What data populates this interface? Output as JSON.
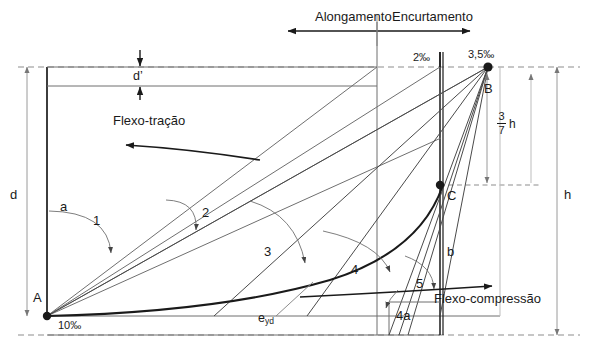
{
  "diagram": {
    "top_axis": {
      "left_label": "Alongamento",
      "right_label": "Encurtamento"
    },
    "points": [
      {
        "id": "A",
        "label": "A",
        "x": 47,
        "y": 316
      },
      {
        "id": "B",
        "label": "B",
        "x": 488,
        "y": 67
      },
      {
        "id": "C",
        "label": "C",
        "x": 440,
        "y": 185
      }
    ],
    "strain_labels": {
      "bottom_left": "10‰",
      "top_mid": "2‰",
      "top_right": "3,5‰",
      "yield": "e",
      "yield_sub": "yd"
    },
    "dimensions": {
      "d_prime": "d’",
      "d": "d",
      "h": "h",
      "fraction_numerator": "3",
      "fraction_denominator": "7",
      "fraction_unit": "h"
    },
    "flow_labels": {
      "tension": "Flexo-tração",
      "compression": "Flexo-compressão"
    },
    "region_labels": [
      {
        "name": "a",
        "text": "a",
        "x": 60,
        "y": 200
      },
      {
        "name": "b",
        "text": "b",
        "x": 447,
        "y": 245
      },
      {
        "name": "domain-1",
        "text": "1",
        "x": 93,
        "y": 221
      },
      {
        "name": "domain-2",
        "text": "2",
        "x": 202,
        "y": 213
      },
      {
        "name": "domain-3",
        "text": "3",
        "x": 264,
        "y": 252
      },
      {
        "name": "domain-4",
        "text": "4",
        "x": 351,
        "y": 270
      },
      {
        "name": "domain-4a",
        "text": "4a",
        "x": 396,
        "y": 316
      },
      {
        "name": "domain-5",
        "text": "5",
        "x": 416,
        "y": 284
      }
    ],
    "colors": {
      "stroke_dark": "#1a1a1a",
      "stroke_mid": "#555555",
      "stroke_light": "#9a9a9a",
      "background": "#ffffff"
    }
  }
}
